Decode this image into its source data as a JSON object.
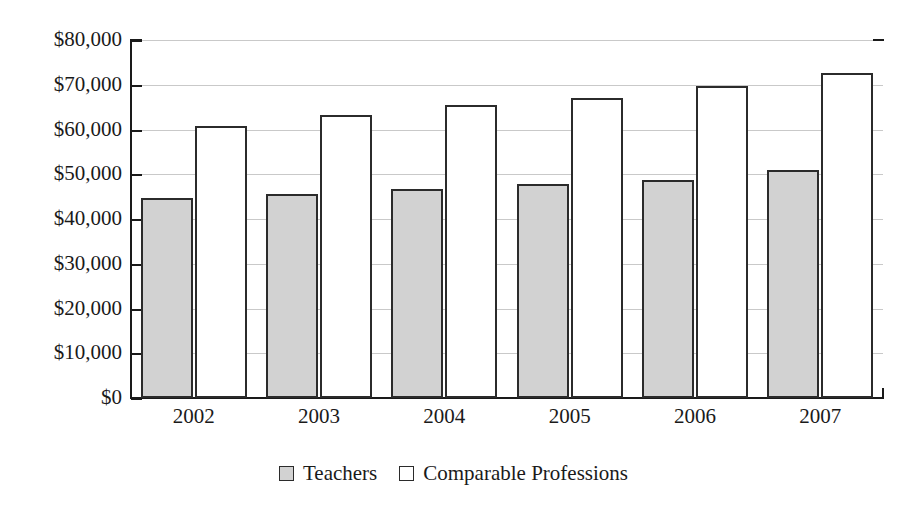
{
  "chart_data": {
    "type": "bar",
    "title": "",
    "subtitle": "",
    "xlabel": "",
    "ylabel": "",
    "categories": [
      "2002",
      "2003",
      "2004",
      "2005",
      "2006",
      "2007"
    ],
    "series": [
      {
        "name": "Teachers",
        "color": "#d2d2d2",
        "values": [
          44800,
          45600,
          46800,
          47800,
          48800,
          51000
        ]
      },
      {
        "name": "Comparable Professions",
        "color": "#ffffff",
        "values": [
          60800,
          63200,
          65400,
          67000,
          69800,
          72700
        ]
      }
    ],
    "ylim": [
      0,
      80000
    ],
    "ytick_step": 10000,
    "ytick_labels": [
      "$0",
      "$10,000",
      "$20,000",
      "$30,000",
      "$40,000",
      "$50,000",
      "$60,000",
      "$70,000",
      "$80,000"
    ],
    "ytick_values": [
      0,
      10000,
      20000,
      30000,
      40000,
      50000,
      60000,
      70000,
      80000
    ],
    "grid": true,
    "grid_axis": "y",
    "legend_position": "bottom-center",
    "legend_entries": [
      "Teachers",
      "Comparable Professions"
    ],
    "annotations": []
  },
  "legend": {
    "items": [
      {
        "label": "Teachers",
        "swatch": "filled-gray-square"
      },
      {
        "label": "Comparable Professions",
        "swatch": "empty-white-square"
      }
    ]
  },
  "colors": {
    "teachers_fill": "#d2d2d2",
    "comparable_fill": "#ffffff",
    "bar_outline": "#2b2b2b",
    "axis": "#1a1a1a",
    "grid": "#c9c9c9",
    "background": "#ffffff",
    "text": "#1a1a1a"
  }
}
